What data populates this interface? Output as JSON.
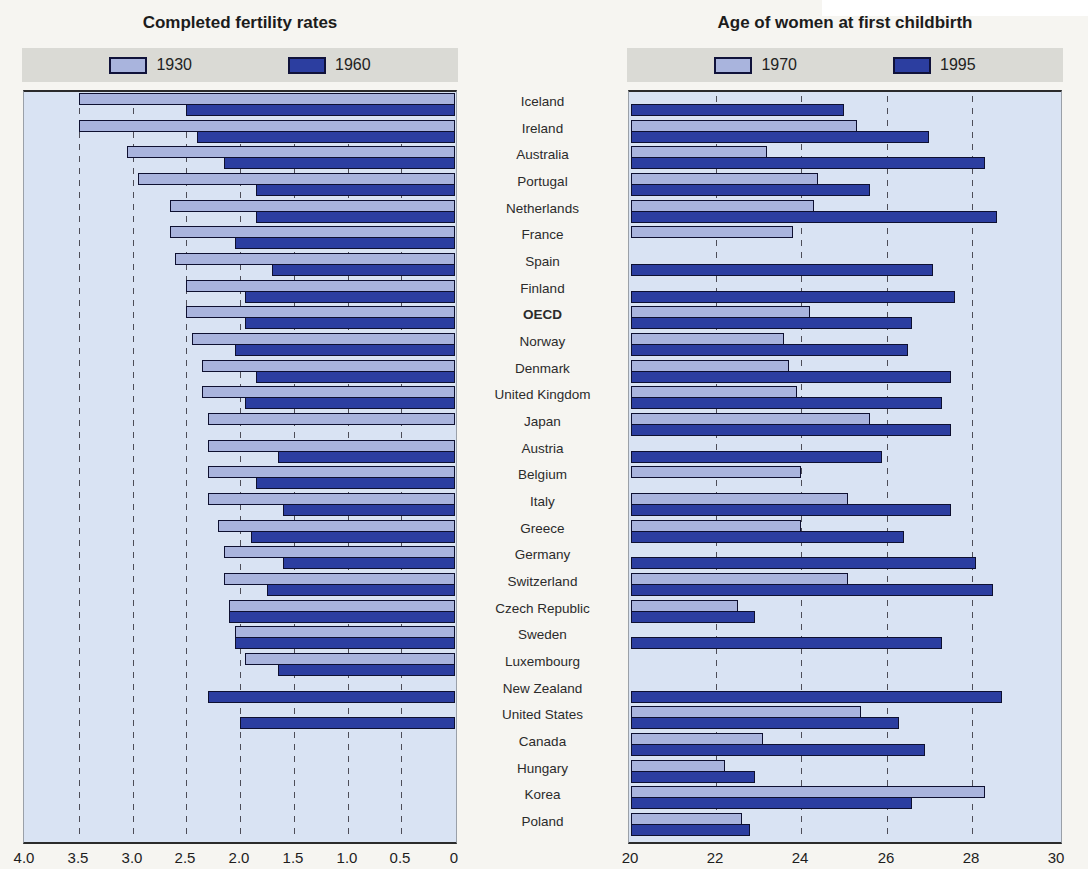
{
  "page": {
    "background": "#f6f5f1",
    "plot_background": "#d9e3f3",
    "legend_background": "#dadad5"
  },
  "colors": {
    "series_light": "#a9b4dd",
    "series_dark": "#2c3ea0",
    "bar_border": "#0e1030",
    "gridline": "#4d4d58",
    "frame": "#2b2b2b"
  },
  "row_labels": {
    "items": [
      {
        "label": "Iceland",
        "bold": false
      },
      {
        "label": "Ireland",
        "bold": false
      },
      {
        "label": "Australia",
        "bold": false
      },
      {
        "label": "Portugal",
        "bold": false
      },
      {
        "label": "Netherlands",
        "bold": false
      },
      {
        "label": "France",
        "bold": false
      },
      {
        "label": "Spain",
        "bold": false
      },
      {
        "label": "Finland",
        "bold": false
      },
      {
        "label": "OECD",
        "bold": true
      },
      {
        "label": "Norway",
        "bold": false
      },
      {
        "label": "Denmark",
        "bold": false
      },
      {
        "label": "United Kingdom",
        "bold": false
      },
      {
        "label": "Japan",
        "bold": false
      },
      {
        "label": "Austria",
        "bold": false
      },
      {
        "label": "Belgium",
        "bold": false
      },
      {
        "label": "Italy",
        "bold": false
      },
      {
        "label": "Greece",
        "bold": false
      },
      {
        "label": "Germany",
        "bold": false
      },
      {
        "label": "Switzerland",
        "bold": false
      },
      {
        "label": "Czech Republic",
        "bold": false
      },
      {
        "label": "Sweden",
        "bold": false
      },
      {
        "label": "Luxembourg",
        "bold": false
      },
      {
        "label": "New Zealand",
        "bold": false
      },
      {
        "label": "United States",
        "bold": false
      },
      {
        "label": "Canada",
        "bold": false
      },
      {
        "label": "Hungary",
        "bold": false
      },
      {
        "label": "Korea",
        "bold": false
      },
      {
        "label": "Poland",
        "bold": false
      }
    ]
  },
  "chart_data": [
    {
      "type": "bar",
      "orientation": "horizontal",
      "title": "Completed fertility rates",
      "categories": [
        "Iceland",
        "Ireland",
        "Australia",
        "Portugal",
        "Netherlands",
        "France",
        "Spain",
        "Finland",
        "OECD",
        "Norway",
        "Denmark",
        "United Kingdom",
        "Japan",
        "Austria",
        "Belgium",
        "Italy",
        "Greece",
        "Germany",
        "Switzerland",
        "Czech Republic",
        "Sweden",
        "Luxembourg",
        "New Zealand",
        "United States",
        "Canada",
        "Hungary",
        "Korea",
        "Poland"
      ],
      "axis": {
        "min": 0,
        "max": 4,
        "reversed": true,
        "tick_labels": [
          "4.0",
          "3.5",
          "3.0",
          "2.5",
          "2.0",
          "1.5",
          "1.0",
          "0.5",
          "0"
        ],
        "tick_values": [
          4.0,
          3.5,
          3.0,
          2.5,
          2.0,
          1.5,
          1.0,
          0.5,
          0
        ],
        "gridlines": [
          3.5,
          3.0,
          2.5,
          2.0,
          1.5,
          1.0,
          0.5
        ],
        "grid": true
      },
      "legend_position": "top",
      "series": [
        {
          "name": "1930",
          "palette": "light",
          "values": [
            3.5,
            3.5,
            3.05,
            2.95,
            2.65,
            2.65,
            2.6,
            2.5,
            2.5,
            2.45,
            2.35,
            2.35,
            2.3,
            2.3,
            2.3,
            2.3,
            2.2,
            2.15,
            2.15,
            2.1,
            2.05,
            1.95,
            null,
            null,
            null,
            null,
            null,
            null
          ]
        },
        {
          "name": "1960",
          "palette": "dark",
          "values": [
            2.5,
            2.4,
            2.15,
            1.85,
            1.85,
            2.05,
            1.7,
            1.95,
            1.95,
            2.05,
            1.85,
            1.95,
            null,
            1.65,
            1.85,
            1.6,
            1.9,
            1.6,
            1.75,
            2.1,
            2.05,
            1.65,
            2.3,
            2.0,
            null,
            null,
            null,
            null
          ]
        }
      ]
    },
    {
      "type": "bar",
      "orientation": "horizontal",
      "title": "Age of women at first childbirth",
      "categories": [
        "Iceland",
        "Ireland",
        "Australia",
        "Portugal",
        "Netherlands",
        "France",
        "Spain",
        "Finland",
        "OECD",
        "Norway",
        "Denmark",
        "United Kingdom",
        "Japan",
        "Austria",
        "Belgium",
        "Italy",
        "Greece",
        "Germany",
        "Switzerland",
        "Czech Republic",
        "Sweden",
        "Luxembourg",
        "New Zealand",
        "United States",
        "Canada",
        "Hungary",
        "Korea",
        "Poland"
      ],
      "axis": {
        "min": 20,
        "max": 30,
        "reversed": false,
        "tick_labels": [
          "20",
          "22",
          "24",
          "26",
          "28",
          "30"
        ],
        "tick_values": [
          20,
          22,
          24,
          26,
          28,
          30
        ],
        "gridlines": [
          22,
          24,
          26,
          28
        ],
        "grid": true
      },
      "legend_position": "top",
      "series": [
        {
          "name": "1970",
          "palette": "light",
          "values": [
            null,
            25.3,
            23.2,
            24.4,
            24.3,
            23.8,
            null,
            null,
            24.2,
            23.6,
            23.7,
            23.9,
            25.6,
            null,
            24.0,
            25.1,
            24.0,
            null,
            25.1,
            22.5,
            null,
            null,
            null,
            25.4,
            23.1,
            22.2,
            28.3,
            22.6
          ]
        },
        {
          "name": "1995",
          "palette": "dark",
          "values": [
            25.0,
            27.0,
            28.3,
            25.6,
            28.6,
            null,
            27.1,
            27.6,
            26.6,
            26.5,
            27.5,
            27.3,
            27.5,
            25.9,
            null,
            27.5,
            26.4,
            28.1,
            28.5,
            22.9,
            27.3,
            null,
            28.7,
            26.3,
            26.9,
            22.9,
            26.6,
            22.8
          ]
        }
      ]
    }
  ]
}
